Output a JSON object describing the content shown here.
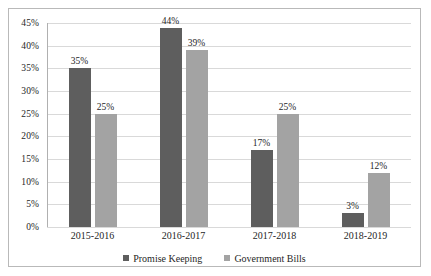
{
  "chart_data": {
    "type": "bar",
    "title": "",
    "subtitle": "",
    "xlabel": "",
    "ylabel": "",
    "categories": [
      "2015-2016",
      "2016-2017",
      "2017-2018",
      "2018-2019"
    ],
    "series": [
      {
        "name": "Promise Keeping",
        "color": "#5e5e5e",
        "values": [
          35,
          44,
          17,
          3
        ],
        "labels": [
          "35%",
          "44%",
          "17%",
          "3%"
        ]
      },
      {
        "name": "Government Bills",
        "color": "#a3a3a3",
        "values": [
          25,
          39,
          25,
          12
        ],
        "labels": [
          "25%",
          "39%",
          "25%",
          "12%"
        ]
      }
    ],
    "ylim": [
      0,
      45
    ],
    "ytick_values": [
      0,
      5,
      10,
      15,
      20,
      25,
      30,
      35,
      40,
      45
    ],
    "ytick_labels": [
      "0%",
      "5%",
      "10%",
      "15%",
      "20%",
      "25%",
      "30%",
      "35%",
      "40%",
      "45%"
    ],
    "grid": true,
    "grid_axis": "y",
    "legend_position": "bottom",
    "value_labels_shown": true
  }
}
